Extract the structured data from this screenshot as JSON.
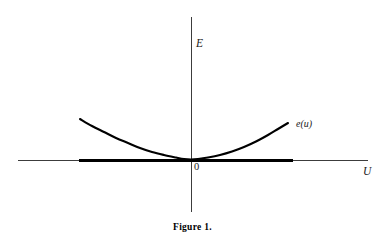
{
  "figure": {
    "caption": "Figure 1.",
    "background_color": "#ffffff",
    "ink_color": "#000000"
  },
  "labels": {
    "y_axis": "E",
    "x_axis": "U",
    "origin": "0",
    "curve": "e(u)"
  },
  "chart_data": {
    "type": "line",
    "title": "Figure 1.",
    "xlabel": "U",
    "ylabel": "E",
    "origin_label": "0",
    "grid": false,
    "legend": false,
    "annotations": [
      {
        "text": "e(u)",
        "x": 0.62,
        "y": 0.21,
        "style": "italic"
      }
    ],
    "axes": {
      "x_axis_px": {
        "x1": 18,
        "x2": 368,
        "y": 160
      },
      "y_axis_px": {
        "x": 191,
        "y1": 17,
        "y2": 212
      },
      "origin_px": {
        "x": 191,
        "y": 160
      }
    },
    "series": [
      {
        "name": "e(u)",
        "description": "Convex energy function, flat-bottomed parabola tangent to the U axis at the origin",
        "style": "solid",
        "linewidth": 2.1,
        "points_px": [
          [
            80,
            119
          ],
          [
            92,
            126
          ],
          [
            104,
            132
          ],
          [
            116,
            138
          ],
          [
            128,
            143
          ],
          [
            140,
            148
          ],
          [
            152,
            152
          ],
          [
            164,
            155
          ],
          [
            176,
            157.5
          ],
          [
            184,
            159
          ],
          [
            191,
            159.5
          ],
          [
            198,
            159
          ],
          [
            208,
            157.5
          ],
          [
            220,
            155
          ],
          [
            232,
            151.5
          ],
          [
            244,
            147
          ],
          [
            256,
            141.5
          ],
          [
            268,
            135
          ],
          [
            278,
            129
          ],
          [
            288,
            123
          ]
        ]
      },
      {
        "name": "emphasis-segment",
        "description": "Thick segment drawn on the U axis marking the interval where e(u) is small",
        "style": "solid-thick",
        "linewidth": 3.2,
        "points_px": [
          [
            79,
            160
          ],
          [
            293,
            160
          ]
        ]
      }
    ],
    "axis_linewidth": 0.9
  }
}
